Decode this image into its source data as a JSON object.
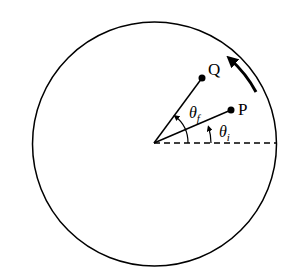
{
  "diagram": {
    "stroke_color": "#000000",
    "background": "#ffffff",
    "circle": {
      "cx": 154.5,
      "cy": 144,
      "r": 122
    },
    "center": {
      "x": 154,
      "y": 143
    },
    "reference_line": {
      "style": "dashed",
      "x2": 277
    },
    "points": [
      {
        "label": "P",
        "x": 231,
        "y": 110
      },
      {
        "label": "Q",
        "x": 202,
        "y": 78
      }
    ],
    "angles": [
      {
        "symbol": "θ",
        "subscript": "i",
        "name": "theta-i"
      },
      {
        "symbol": "θ",
        "subscript": "f",
        "name": "theta-f"
      }
    ],
    "rotation_direction": "counterclockwise"
  }
}
